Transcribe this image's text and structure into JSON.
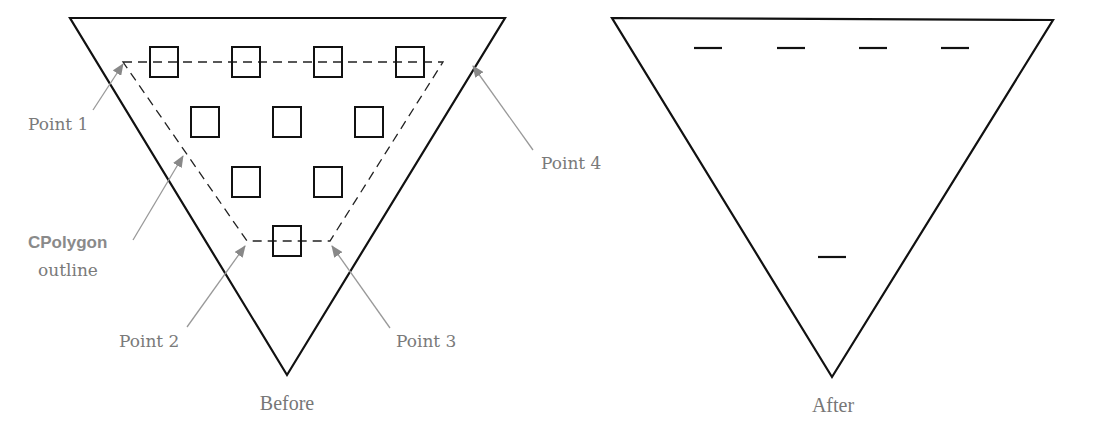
{
  "figure": {
    "before": {
      "caption": "Before",
      "triangle": {
        "points": [
          [
            70,
            18
          ],
          [
            505,
            18
          ],
          [
            287,
            375
          ]
        ],
        "stroke": "#111111"
      },
      "polygon_outline": {
        "style": "dashed",
        "points": [
          {
            "name": "Point 1",
            "x": 123,
            "y": 62
          },
          {
            "name": "Point 4",
            "x": 443,
            "y": 62
          },
          {
            "name": "Point 3",
            "x": 330,
            "y": 241
          },
          {
            "name": "Point 2",
            "x": 247,
            "y": 241
          }
        ]
      },
      "squares": [
        {
          "x": 164,
          "y": 62
        },
        {
          "x": 246,
          "y": 62
        },
        {
          "x": 328,
          "y": 62
        },
        {
          "x": 410,
          "y": 62
        },
        {
          "x": 205,
          "y": 122
        },
        {
          "x": 287,
          "y": 122
        },
        {
          "x": 369,
          "y": 122
        },
        {
          "x": 246,
          "y": 182
        },
        {
          "x": 328,
          "y": 182
        },
        {
          "x": 287,
          "y": 241
        }
      ],
      "labels": {
        "point1": "Point 1",
        "point2": "Point 2",
        "point3": "Point 3",
        "point4": "Point 4",
        "cpolygon": "CPolygon",
        "outline": "outline"
      }
    },
    "after": {
      "caption": "After",
      "triangle": {
        "points": [
          [
            612,
            18
          ],
          [
            1053,
            20
          ],
          [
            832,
            377
          ]
        ],
        "stroke": "#111111"
      },
      "dashes": [
        {
          "x": 708,
          "y": 48
        },
        {
          "x": 791,
          "y": 48
        },
        {
          "x": 873,
          "y": 48
        },
        {
          "x": 955,
          "y": 48
        },
        {
          "x": 832,
          "y": 257
        }
      ]
    },
    "colors": {
      "stroke": "#111111",
      "annotation": "#7a7a7a",
      "arrow": "#888888"
    }
  }
}
